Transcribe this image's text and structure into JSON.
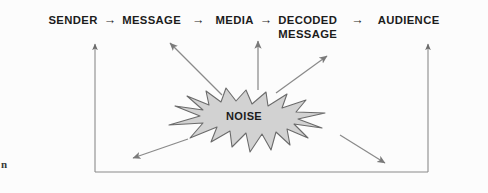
{
  "diagram": {
    "background_color": "#fcfcfc",
    "text_color": "#1c1c1c",
    "line_color": "#6b6b6b",
    "noise_fill_color": "#d2d2d2",
    "noise_stroke_color": "#6b6b6b",
    "chain": [
      {
        "label": "SENDER",
        "connector": "→"
      },
      {
        "label": "MESSAGE",
        "connector": "→"
      },
      {
        "label": "MEDIA",
        "connector": "→"
      },
      {
        "label_line1": "DECODED",
        "label_line2": "MESSAGE",
        "connector": "→"
      },
      {
        "label": "AUDIENCE",
        "connector": ""
      }
    ],
    "noise": {
      "label": "NOISE"
    },
    "edge_fragment": "n",
    "arrows": {
      "noise_to_message": "diagonal-up-left",
      "noise_to_media": "vertical-up",
      "noise_to_decoded_message": "diagonal-up-right",
      "noise_down_left": "diagonal-down-left",
      "noise_down_right": "diagonal-down-right",
      "feedback_to_sender": "vertical-up-left-rail",
      "feedback_from_audience": "vertical-up-right-rail"
    }
  }
}
